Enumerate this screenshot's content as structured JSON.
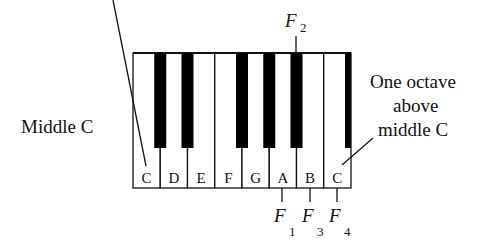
{
  "diagram": {
    "white_keys": [
      "C",
      "D",
      "E",
      "F",
      "G",
      "A",
      "B",
      "C"
    ],
    "black_keys": [
      "C#",
      "D#",
      "F#",
      "G#",
      "A#",
      "C#"
    ],
    "left_label": "Middle C",
    "right_label": [
      "One octave",
      "above",
      "middle C"
    ],
    "markers": {
      "top": {
        "letter": "F",
        "sub": "2",
        "key": "A#"
      },
      "bottom": [
        {
          "letter": "F",
          "sub": "1",
          "key": "A"
        },
        {
          "letter": "F",
          "sub": "3",
          "key": "B"
        },
        {
          "letter": "F",
          "sub": "4",
          "key": "C"
        }
      ]
    },
    "colors": {
      "key_white": "#ffffff",
      "key_black": "#000000",
      "outline": "#111111"
    }
  }
}
